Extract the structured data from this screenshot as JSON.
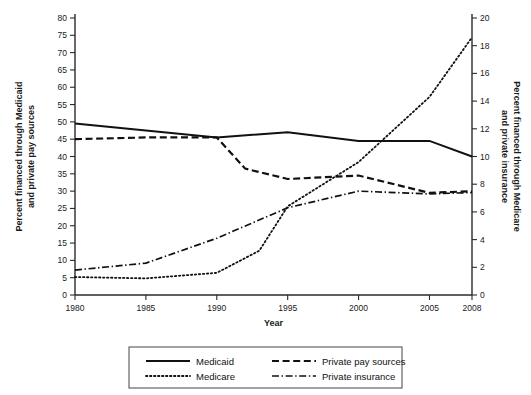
{
  "chart_data": {
    "type": "line",
    "title": "",
    "xlabel": "Year",
    "ylabel": "Percent financed through Medicaid and private pay sources",
    "y2label": "Percent financed through Medicare and private insurance",
    "xlim": [
      1980,
      2008
    ],
    "ylim": [
      0,
      80
    ],
    "y2lim": [
      0,
      20
    ],
    "xticks": [
      1980,
      1985,
      1990,
      1995,
      2000,
      2005,
      2008
    ],
    "xticklabels": [
      "1980",
      "1985",
      "1990",
      "1995",
      "2000",
      "2005",
      "2008"
    ],
    "yticks": [
      0,
      5,
      10,
      15,
      20,
      25,
      30,
      35,
      40,
      45,
      50,
      55,
      60,
      65,
      70,
      75,
      80
    ],
    "yticklabels": [
      "0",
      "5",
      "10",
      "15",
      "20",
      "25",
      "30",
      "35",
      "40",
      "45",
      "50",
      "55",
      "60",
      "65",
      "70",
      "75",
      "80"
    ],
    "y2ticks": [
      0,
      2,
      4,
      6,
      8,
      10,
      12,
      14,
      16,
      18,
      20
    ],
    "y2ticklabels": [
      "0",
      "2",
      "4",
      "6",
      "8",
      "10",
      "12",
      "14",
      "16",
      "18",
      "20"
    ],
    "grid": false,
    "legend_position": "below",
    "series": [
      {
        "name": "Medicaid",
        "axis": "left",
        "style": "solid",
        "x": [
          1980,
          1985,
          1990,
          1995,
          2000,
          2005,
          2008
        ],
        "values": [
          49.5,
          47.5,
          45.5,
          47.0,
          44.5,
          44.5,
          40.0
        ]
      },
      {
        "name": "Private pay sources",
        "axis": "left",
        "style": "dashed",
        "x": [
          1980,
          1985,
          1990,
          1992,
          1995,
          2000,
          2005,
          2008
        ],
        "values": [
          45.0,
          45.5,
          45.5,
          36.5,
          33.5,
          34.5,
          29.5,
          30.0
        ]
      },
      {
        "name": "Medicare",
        "axis": "right",
        "style": "dotted",
        "x": [
          1980,
          1985,
          1990,
          1993,
          1995,
          2000,
          2005,
          2008
        ],
        "values": [
          1.3,
          1.2,
          1.6,
          3.2,
          6.4,
          9.6,
          14.3,
          18.6
        ]
      },
      {
        "name": "Private insurance",
        "axis": "right",
        "style": "dashdot",
        "x": [
          1980,
          1985,
          1990,
          1995,
          2000,
          2005,
          2008
        ],
        "values": [
          1.8,
          2.3,
          4.1,
          6.3,
          7.5,
          7.3,
          7.4
        ]
      }
    ]
  },
  "legend": {
    "entries": [
      {
        "label": "Medicaid",
        "style": "solid"
      },
      {
        "label": "Private pay sources",
        "style": "dashed"
      },
      {
        "label": "Medicare",
        "style": "dotted"
      },
      {
        "label": "Private insurance",
        "style": "dashdot"
      }
    ]
  }
}
